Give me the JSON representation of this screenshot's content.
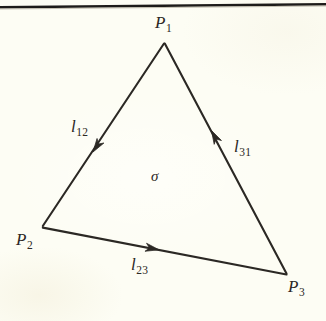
{
  "figure": {
    "kind": "oriented-2-simplex-diagram",
    "background_color": "#fdfdf4",
    "ink_color": "#2b2824",
    "rule_color": "#1d1b19",
    "interior_face_label": "σ",
    "vertex_labels": {
      "p1": {
        "var": "P",
        "sub": "1"
      },
      "p2": {
        "var": "P",
        "sub": "2"
      },
      "p3": {
        "var": "P",
        "sub": "3"
      }
    },
    "edge_labels": {
      "l12": {
        "var": "l",
        "sub": "12"
      },
      "l23": {
        "var": "l",
        "sub": "23"
      },
      "l31": {
        "var": "l",
        "sub": "31"
      }
    },
    "geometry": {
      "p1": {
        "x": 164,
        "y": 42
      },
      "p2": {
        "x": 42,
        "y": 227
      },
      "p3": {
        "x": 287,
        "y": 275
      },
      "arrow_l12": {
        "x": 93,
        "y": 152
      },
      "arrow_l23": {
        "x": 157,
        "y": 249
      },
      "arrow_l31": {
        "x": 212,
        "y": 131
      },
      "top_rule": {
        "x1": 0,
        "y1": 7,
        "x2": 326,
        "y2": 4
      }
    }
  }
}
